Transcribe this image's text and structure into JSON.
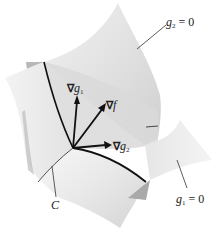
{
  "figure": {
    "type": "3d-surface-intersection",
    "surfaces": [
      {
        "id": "g2",
        "label_var": "g",
        "label_sub": "2",
        "label_rest": " = 0"
      },
      {
        "id": "g1",
        "label_var": "g",
        "label_sub": "1",
        "label_rest": " = 0"
      }
    ],
    "curve": {
      "label": "C"
    },
    "vectors": [
      {
        "id": "grad_g1",
        "nabla": "∇",
        "var": "g",
        "sub": "1"
      },
      {
        "id": "grad_f",
        "nabla": "∇",
        "var": "f",
        "sub": ""
      },
      {
        "id": "grad_g2",
        "nabla": "∇",
        "var": "g",
        "sub": "2"
      }
    ],
    "colors": {
      "surface_light": "#e9e9e9",
      "surface_mid": "#d6d6d6",
      "surface_dark": "#b9b9b9",
      "ink": "#111111",
      "leader": "#333333"
    }
  }
}
